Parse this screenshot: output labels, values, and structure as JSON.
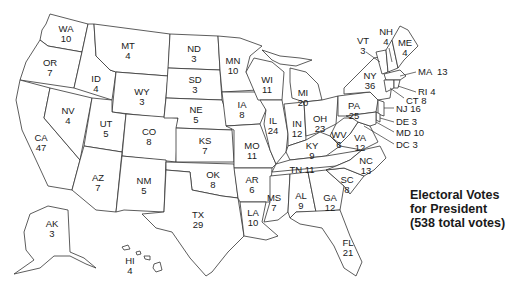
{
  "title": {
    "line1": "Electoral Votes",
    "line2": "for President",
    "line3": "(538 total votes)"
  },
  "total_votes": 538,
  "states": {
    "WA": {
      "abbr": "WA",
      "votes": "10"
    },
    "OR": {
      "abbr": "OR",
      "votes": "7"
    },
    "CA": {
      "abbr": "CA",
      "votes": "47"
    },
    "ID": {
      "abbr": "ID",
      "votes": "4"
    },
    "NV": {
      "abbr": "NV",
      "votes": "4"
    },
    "MT": {
      "abbr": "MT",
      "votes": "4"
    },
    "WY": {
      "abbr": "WY",
      "votes": "3"
    },
    "UT": {
      "abbr": "UT",
      "votes": "5"
    },
    "AZ": {
      "abbr": "AZ",
      "votes": "7"
    },
    "CO": {
      "abbr": "CO",
      "votes": "8"
    },
    "NM": {
      "abbr": "NM",
      "votes": "5"
    },
    "ND": {
      "abbr": "ND",
      "votes": "3"
    },
    "SD": {
      "abbr": "SD",
      "votes": "3"
    },
    "NE": {
      "abbr": "NE",
      "votes": "5"
    },
    "KS": {
      "abbr": "KS",
      "votes": "7"
    },
    "OK": {
      "abbr": "OK",
      "votes": "8"
    },
    "TX": {
      "abbr": "TX",
      "votes": "29"
    },
    "MN": {
      "abbr": "MN",
      "votes": "10"
    },
    "IA": {
      "abbr": "IA",
      "votes": "8"
    },
    "MO": {
      "abbr": "MO",
      "votes": "11"
    },
    "AR": {
      "abbr": "AR",
      "votes": "6"
    },
    "LA": {
      "abbr": "LA",
      "votes": "10"
    },
    "WI": {
      "abbr": "WI",
      "votes": "11"
    },
    "IL": {
      "abbr": "IL",
      "votes": "24"
    },
    "MI": {
      "abbr": "MI",
      "votes": "20"
    },
    "IN": {
      "abbr": "IN",
      "votes": "12"
    },
    "OH": {
      "abbr": "OH",
      "votes": "23"
    },
    "KY": {
      "abbr": "KY",
      "votes": "9"
    },
    "TN": {
      "abbr": "TN",
      "votes": "11"
    },
    "MS": {
      "abbr": "MS",
      "votes": "7"
    },
    "AL": {
      "abbr": "AL",
      "votes": "9"
    },
    "GA": {
      "abbr": "GA",
      "votes": "12"
    },
    "FL": {
      "abbr": "FL",
      "votes": "21"
    },
    "SC": {
      "abbr": "SC",
      "votes": "8"
    },
    "NC": {
      "abbr": "NC",
      "votes": "13"
    },
    "VA": {
      "abbr": "VA",
      "votes": "12"
    },
    "WV": {
      "abbr": "WV",
      "votes": "6"
    },
    "PA": {
      "abbr": "PA",
      "votes": "25"
    },
    "NY": {
      "abbr": "NY",
      "votes": "36"
    },
    "VT": {
      "abbr": "VT",
      "votes": "3"
    },
    "NH": {
      "abbr": "NH",
      "votes": "4"
    },
    "ME": {
      "abbr": "ME",
      "votes": "4"
    },
    "MA": {
      "abbr": "MA",
      "votes": "13"
    },
    "RI": {
      "abbr": "RI",
      "votes": "4"
    },
    "CT": {
      "abbr": "CT",
      "votes": "8"
    },
    "NJ": {
      "abbr": "NJ",
      "votes": "16"
    },
    "DE": {
      "abbr": "DE",
      "votes": "3"
    },
    "MD": {
      "abbr": "MD",
      "votes": "10"
    },
    "DC": {
      "abbr": "DC",
      "votes": "3"
    },
    "AK": {
      "abbr": "AK",
      "votes": "3"
    },
    "HI": {
      "abbr": "HI",
      "votes": "4"
    }
  }
}
